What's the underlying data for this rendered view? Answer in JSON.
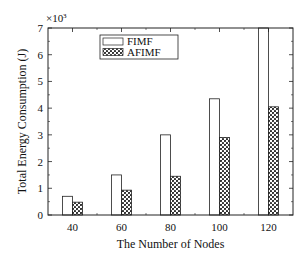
{
  "chart_data": {
    "type": "bar",
    "title": "",
    "xlabel": "The Number of Nodes",
    "ylabel": "Total Energy Consumption (J)",
    "y_multiplier_label": "×10",
    "y_multiplier_exponent": "3",
    "categories": [
      "40",
      "60",
      "80",
      "100",
      "120"
    ],
    "series": [
      {
        "name": "FIMF",
        "pattern": "none",
        "fill": "#ffffff",
        "values": [
          0.7,
          1.5,
          3.0,
          4.35,
          7.0
        ]
      },
      {
        "name": "AFIMF",
        "pattern": "crosshatch",
        "fill": "#333333",
        "values": [
          0.48,
          0.93,
          1.45,
          2.9,
          4.05
        ]
      }
    ],
    "ylim": [
      0,
      7
    ],
    "yticks": [
      "0",
      "1",
      "2",
      "3",
      "4",
      "5",
      "6",
      "7"
    ],
    "grid": false,
    "legend_position": "upper-left-inside"
  }
}
